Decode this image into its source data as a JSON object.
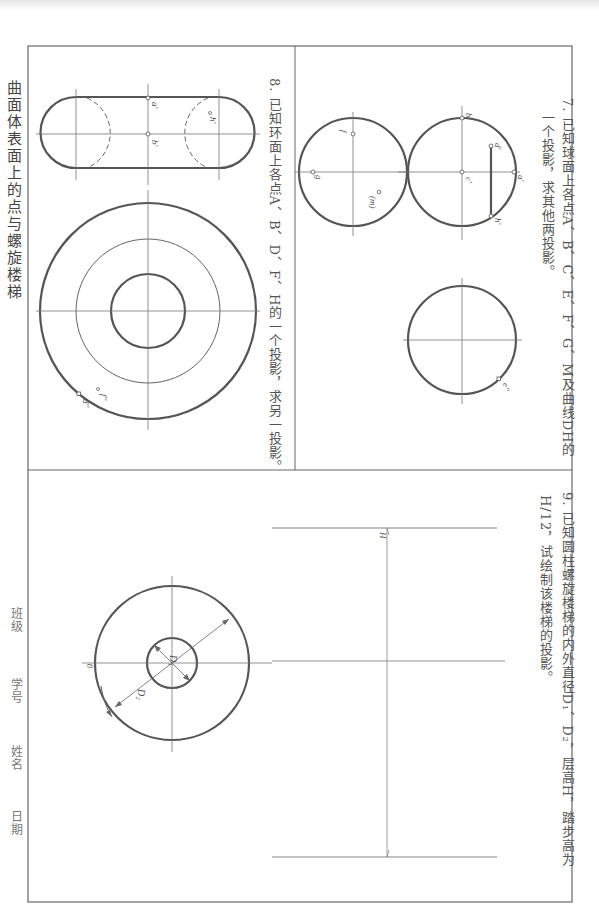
{
  "page": {
    "title": "曲面体表面上的点与螺旋楼梯",
    "footer_fields": [
      "班级",
      "学号",
      "姓名",
      "日期"
    ]
  },
  "exercise7": {
    "number": "7.",
    "text_line1": "已知球面上各点A、B、C、E、F、G、M及曲线DH的",
    "text_line2": "一个投影，求其他两投影。",
    "labels": [
      "a'",
      "b'",
      "c'",
      "d'",
      "h'",
      "f",
      "g",
      "(m)",
      "e''"
    ]
  },
  "exercise8": {
    "number": "8.",
    "text_line1": "已知环面上各点A、B、D、F、H的一个投影，求另一投影。",
    "labels": [
      "a'",
      "b'",
      "h'",
      "f''",
      "d''"
    ]
  },
  "exercise9": {
    "number": "9.",
    "text_line1": "已知圆柱螺旋楼梯的内外直径D₁、D₂，层高H，踏步高为",
    "text_line2": "H/12，试绘制该楼梯的投影。",
    "labels": [
      "H",
      "D₁",
      "D₂",
      "0"
    ]
  },
  "colors": {
    "line_thick": "#555555",
    "line_thin": "#777777",
    "text": "#555555"
  }
}
